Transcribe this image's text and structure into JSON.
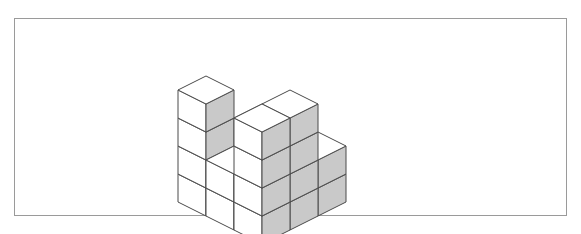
{
  "figure": {
    "title": "",
    "type": "isometric-cube-structure",
    "frame": {
      "x": 14,
      "y": 18,
      "width": 553,
      "height": 198,
      "border_color": "#9a9a9a",
      "border_width": 1,
      "background": "#ffffff"
    },
    "colors": {
      "top_face": "#ffffff",
      "left_face": "#ffffff",
      "right_face": "#c9c9c9",
      "edge": "#4a4a4a",
      "page_background": "#ffffff"
    },
    "projection": {
      "type": "isometric",
      "origin_x": 262,
      "origin_y": 160,
      "unit_x_dx": 28,
      "unit_x_dy": 14,
      "unit_y_dx": -28,
      "unit_y_dy": 14,
      "unit_z_dy": -28
    },
    "grid_size": {
      "x": 3,
      "y": 3,
      "z": 4
    },
    "cube_count": 22,
    "cubes": [
      {
        "x": 0,
        "y": 0,
        "z": 0
      },
      {
        "x": 0,
        "y": 0,
        "z": 1
      },
      {
        "x": 0,
        "y": 1,
        "z": 0
      },
      {
        "x": 0,
        "y": 1,
        "z": 1
      },
      {
        "x": 0,
        "y": 2,
        "z": 0
      },
      {
        "x": 0,
        "y": 2,
        "z": 1
      },
      {
        "x": 0,
        "y": 2,
        "z": 2
      },
      {
        "x": 0,
        "y": 2,
        "z": 3
      },
      {
        "x": 1,
        "y": 0,
        "z": 0
      },
      {
        "x": 1,
        "y": 2,
        "z": 0
      },
      {
        "x": 1,
        "y": 2,
        "z": 1
      },
      {
        "x": 2,
        "y": 0,
        "z": 0
      },
      {
        "x": 2,
        "y": 0,
        "z": 1
      },
      {
        "x": 2,
        "y": 1,
        "z": 0
      },
      {
        "x": 2,
        "y": 1,
        "z": 1
      },
      {
        "x": 2,
        "y": 1,
        "z": 2
      },
      {
        "x": 2,
        "y": 1,
        "z": 3
      },
      {
        "x": 2,
        "y": 2,
        "z": 0
      },
      {
        "x": 2,
        "y": 2,
        "z": 1
      },
      {
        "x": 2,
        "y": 2,
        "z": 2
      },
      {
        "x": 2,
        "y": 2,
        "z": 3
      },
      {
        "x": 1,
        "y": 1,
        "z": 0
      }
    ]
  }
}
